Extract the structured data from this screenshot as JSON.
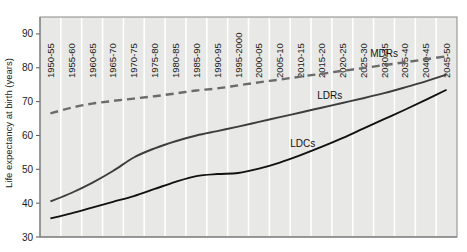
{
  "chart_data": {
    "type": "line",
    "title": "",
    "subtitle": "",
    "xlabel": "",
    "ylabel": "Life expectancy at birth (years)",
    "ylim": [
      30,
      95
    ],
    "yticks": [
      30,
      40,
      50,
      60,
      70,
      80,
      90
    ],
    "grid": "vertical-white-gridlines",
    "legend_position": "inline-labels",
    "plot_background": "#e8e8e6",
    "categories": [
      "1950-55",
      "1955-60",
      "1960-65",
      "1965-70",
      "1970-75",
      "1975-80",
      "1980-85",
      "1985-90",
      "1990-95",
      "1995-2000",
      "2000-05",
      "2005-10",
      "2010-15",
      "2015-20",
      "2020-25",
      "2025-30",
      "2030-35",
      "2035-40",
      "2040-45",
      "2045-50"
    ],
    "series": [
      {
        "name": "MDRs",
        "style": "dashed",
        "color": "#6b6b6b",
        "values": [
          66.5,
          68.2,
          69.4,
          70.2,
          70.9,
          71.6,
          72.4,
          73.3,
          73.9,
          74.8,
          75.7,
          76.5,
          77.4,
          78.2,
          79.1,
          79.9,
          80.8,
          81.6,
          82.5,
          83.4
        ]
      },
      {
        "name": "LDRs",
        "style": "solid",
        "color": "#3d3d3d",
        "values": [
          40.5,
          43.0,
          46.0,
          49.5,
          53.5,
          56.2,
          58.3,
          60.0,
          61.3,
          62.6,
          64.0,
          65.4,
          66.8,
          68.2,
          69.6,
          71.0,
          72.5,
          74.2,
          76.0,
          78.0
        ]
      },
      {
        "name": "LDCs",
        "style": "solid",
        "color": "#111111",
        "values": [
          35.5,
          37.0,
          38.7,
          40.4,
          42.1,
          44.2,
          46.3,
          48.0,
          48.6,
          48.9,
          50.2,
          52.0,
          54.2,
          56.6,
          59.2,
          62.0,
          64.8,
          67.6,
          70.5,
          73.5
        ]
      }
    ],
    "annotations": [
      {
        "text": "MDRs",
        "series": "MDRs"
      },
      {
        "text": "LDRs",
        "series": "LDRs"
      },
      {
        "text": "LDCs",
        "series": "LDCs"
      }
    ]
  }
}
